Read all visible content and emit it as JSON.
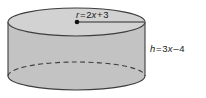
{
  "figure": {
    "shape_name": "cylinder",
    "background_color": "#ffffff",
    "top_face_color": "#d2d2d2",
    "body_color": "#c3c3c3",
    "outline_color": "#3d3d3d",
    "dashed_arc_color": "#3d3d3d",
    "text_color": "#1a1a1a"
  },
  "labels": {
    "radius": {
      "name": "r",
      "equals": "=",
      "expression": "2x + 3",
      "full_text": "r = 2x + 3",
      "coefficient": "2",
      "variable": "x",
      "operator": "+",
      "constant": "3"
    },
    "height": {
      "name": "h",
      "equals": "=",
      "expression": "3x – 4",
      "full_text": "h = 3x – 4",
      "coefficient": "3",
      "variable": "x",
      "operator": "–",
      "constant": "4"
    }
  },
  "annotations": {
    "radius_line": "radius-segment-from-center-to-rim",
    "center_point": "center-dot-on-top-face",
    "hidden_edge": "dashed-back-arc-of-bottom-rim"
  }
}
